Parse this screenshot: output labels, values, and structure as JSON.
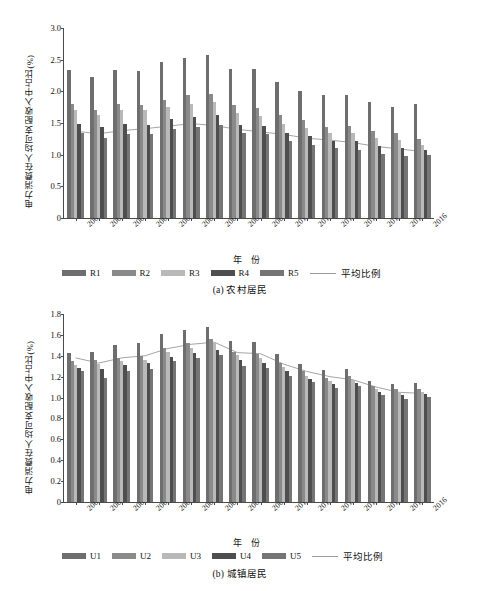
{
  "figure": {
    "axis_label_y": "电力消费在人均可支配收入中占比(%)",
    "axis_label_x": "年 份",
    "avg_legend_label": "平均比例"
  },
  "panel_a": {
    "caption": "(a) 农村居民",
    "chart_data": {
      "type": "bar",
      "title": "(a) 农村居民",
      "xlabel": "年 份",
      "ylabel": "电力消费在人均可支配收入中占比(%)",
      "ylim": [
        0,
        3.0
      ],
      "yticks": [
        "0",
        "0.5",
        "1.0",
        "1.5",
        "2.0",
        "2.5",
        "3.0"
      ],
      "grid": false,
      "legend_position": "bottom",
      "categories": [
        "2001",
        "2002",
        "2003",
        "2004",
        "2005",
        "2006",
        "2007",
        "2008",
        "2009",
        "2010",
        "2011",
        "2012",
        "2013",
        "2014",
        "2015",
        "2016"
      ],
      "series": [
        {
          "name": "R1",
          "color": "#6e6e6e",
          "values": [
            2.34,
            2.22,
            2.33,
            2.32,
            2.46,
            2.52,
            2.57,
            2.36,
            2.36,
            2.15,
            2.01,
            1.94,
            1.95,
            1.83,
            1.76,
            1.8
          ]
        },
        {
          "name": "R2",
          "color": "#8a8a8a",
          "values": [
            1.8,
            1.71,
            1.8,
            1.79,
            1.87,
            1.94,
            1.96,
            1.78,
            1.74,
            1.62,
            1.55,
            1.44,
            1.45,
            1.37,
            1.34,
            1.25
          ]
        },
        {
          "name": "R3",
          "color": "#b9b9b9",
          "values": [
            1.71,
            1.62,
            1.71,
            1.7,
            1.76,
            1.8,
            1.83,
            1.66,
            1.61,
            1.49,
            1.42,
            1.34,
            1.34,
            1.27,
            1.23,
            1.16
          ]
        },
        {
          "name": "R4",
          "color": "#4e4e4e",
          "values": [
            1.49,
            1.43,
            1.48,
            1.47,
            1.56,
            1.6,
            1.63,
            1.47,
            1.45,
            1.35,
            1.29,
            1.21,
            1.21,
            1.14,
            1.1,
            1.08
          ]
        },
        {
          "name": "R5",
          "color": "#757575",
          "values": [
            1.34,
            1.27,
            1.32,
            1.32,
            1.4,
            1.44,
            1.47,
            1.34,
            1.32,
            1.22,
            1.15,
            1.1,
            1.08,
            1.01,
            0.98,
            1.0
          ]
        }
      ],
      "average_line": {
        "name": "平均比例",
        "color": "#9a9a9a",
        "values": [
          1.37,
          1.33,
          1.38,
          1.41,
          1.45,
          1.49,
          1.46,
          1.4,
          1.36,
          1.32,
          1.26,
          1.23,
          1.19,
          1.13,
          1.09,
          1.05
        ]
      }
    }
  },
  "panel_b": {
    "caption": "(b) 城镇居民",
    "chart_data": {
      "type": "bar",
      "title": "(b) 城镇居民",
      "xlabel": "年 份",
      "ylabel": "电力消费在人均可支配收入中占比(%)",
      "ylim": [
        0,
        1.8
      ],
      "yticks": [
        "0",
        "0.2",
        "0.4",
        "0.6",
        "0.8",
        "1.0",
        "1.2",
        "1.4",
        "1.6",
        "1.8"
      ],
      "grid": false,
      "legend_position": "bottom",
      "categories": [
        "2001",
        "2002",
        "2003",
        "2004",
        "2005",
        "2006",
        "2007",
        "2008",
        "2009",
        "2010",
        "2011",
        "2012",
        "2013",
        "2014",
        "2015",
        "2016"
      ],
      "series": [
        {
          "name": "U1",
          "color": "#6e6e6e",
          "values": [
            1.43,
            1.44,
            1.5,
            1.52,
            1.61,
            1.65,
            1.68,
            1.54,
            1.53,
            1.42,
            1.32,
            1.26,
            1.27,
            1.16,
            1.13,
            1.14
          ]
        },
        {
          "name": "U2",
          "color": "#8a8a8a",
          "values": [
            1.35,
            1.36,
            1.38,
            1.4,
            1.47,
            1.52,
            1.56,
            1.44,
            1.42,
            1.33,
            1.25,
            1.19,
            1.21,
            1.11,
            1.08,
            1.08
          ]
        },
        {
          "name": "U3",
          "color": "#b9b9b9",
          "values": [
            1.31,
            1.32,
            1.35,
            1.36,
            1.44,
            1.47,
            1.52,
            1.41,
            1.38,
            1.29,
            1.21,
            1.16,
            1.17,
            1.08,
            1.05,
            1.05
          ]
        },
        {
          "name": "U4",
          "color": "#4e4e4e",
          "values": [
            1.28,
            1.27,
            1.31,
            1.33,
            1.39,
            1.43,
            1.46,
            1.36,
            1.33,
            1.25,
            1.18,
            1.13,
            1.14,
            1.05,
            1.02,
            1.03
          ]
        },
        {
          "name": "U5",
          "color": "#757575",
          "values": [
            1.25,
            1.19,
            1.25,
            1.27,
            1.35,
            1.38,
            1.41,
            1.3,
            1.28,
            1.21,
            1.15,
            1.09,
            1.11,
            1.02,
            0.99,
            1.01
          ]
        }
      ],
      "average_line": {
        "name": "平均比例",
        "color": "#9a9a9a",
        "values": [
          1.38,
          1.33,
          1.38,
          1.4,
          1.47,
          1.51,
          1.53,
          1.43,
          1.42,
          1.32,
          1.25,
          1.2,
          1.17,
          1.1,
          1.05,
          1.04
        ]
      }
    }
  }
}
